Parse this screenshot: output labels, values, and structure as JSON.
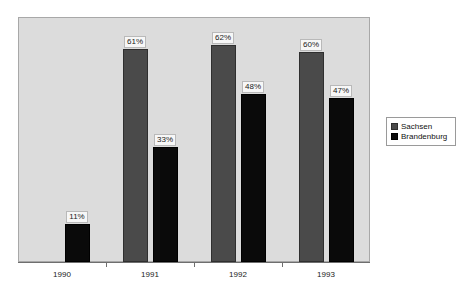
{
  "chart_data": {
    "type": "bar",
    "title": "",
    "subtitle": "",
    "xlabel": "",
    "ylabel": "",
    "grid": false,
    "ylim": [
      0,
      70
    ],
    "legend_position": "right",
    "categories": [
      "1990",
      "1991",
      "1992",
      "1993"
    ],
    "series": [
      {
        "name": "Sachsen",
        "color": "#4a4a4a",
        "values": [
          null,
          61,
          62,
          60
        ],
        "labels": [
          "",
          "61%",
          "62%",
          "60%"
        ]
      },
      {
        "name": "Brandenburg",
        "color": "#0a0a0a",
        "values": [
          11,
          33,
          48,
          47
        ],
        "labels": [
          "11%",
          "33%",
          "48%",
          "47%"
        ]
      }
    ]
  },
  "legend": {
    "items": [
      {
        "label": "Sachsen",
        "swatch": "sachsen-swatch-icon"
      },
      {
        "label": "Brandenburg",
        "swatch": "brandenburg-swatch-icon"
      }
    ]
  },
  "axis": {
    "x_tick_labels": [
      "1990",
      "1991",
      "1992",
      "1993"
    ]
  },
  "colors": {
    "plot_background": "#dcdcdc",
    "plot_border": "#a8a8a8",
    "sachsen": "#4a4a4a",
    "brandenburg": "#0a0a0a",
    "label_background": "#f7f7f7",
    "axis": "#6e6e6e",
    "page_background": "#ffffff"
  }
}
